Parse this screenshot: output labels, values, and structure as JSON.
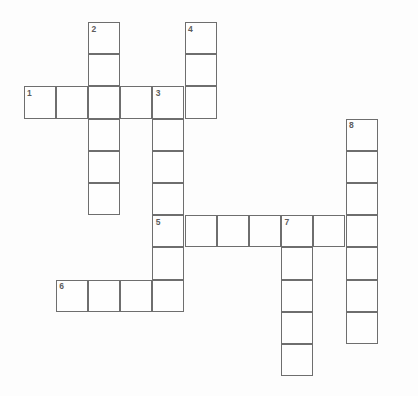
{
  "puzzle": {
    "title": "Crossword Puzzle Grid",
    "background_color": "#fdfdfd",
    "cell_fill_color": "#fefefe",
    "cell_border_color": "#6e6e6e",
    "number_color": "#5c5c5c",
    "cell_size": 32.2,
    "origin_x": 23.5,
    "origin_y": 22.0,
    "columns": 11,
    "rows": 11,
    "entries": [
      {
        "number": "1",
        "direction": "across",
        "start_col": 0,
        "start_row": 2,
        "length": 6,
        "answer": ""
      },
      {
        "number": "2",
        "direction": "down",
        "start_col": 2,
        "start_row": 0,
        "length": 6,
        "answer": ""
      },
      {
        "number": "3",
        "direction": "down",
        "start_col": 4,
        "start_row": 2,
        "length": 7,
        "answer": ""
      },
      {
        "number": "4",
        "direction": "down",
        "start_col": 5,
        "start_row": 0,
        "length": 3,
        "answer": ""
      },
      {
        "number": "5",
        "direction": "across",
        "start_col": 4,
        "start_row": 6,
        "length": 7,
        "answer": ""
      },
      {
        "number": "6",
        "direction": "across",
        "start_col": 1,
        "start_row": 8,
        "length": 4,
        "answer": ""
      },
      {
        "number": "7",
        "direction": "down",
        "start_col": 8,
        "start_row": 6,
        "length": 5,
        "answer": ""
      },
      {
        "number": "8",
        "direction": "down",
        "start_col": 10,
        "start_row": 3,
        "length": 7,
        "answer": ""
      }
    ],
    "numbered_cells": [
      {
        "label": "1",
        "col": 0,
        "row": 2
      },
      {
        "label": "2",
        "col": 2,
        "row": 0
      },
      {
        "label": "3",
        "col": 4,
        "row": 2
      },
      {
        "label": "4",
        "col": 5,
        "row": 0
      },
      {
        "label": "5",
        "col": 4,
        "row": 6
      },
      {
        "label": "6",
        "col": 1,
        "row": 8
      },
      {
        "label": "7",
        "col": 8,
        "row": 6
      },
      {
        "label": "8",
        "col": 10,
        "row": 3
      }
    ]
  }
}
